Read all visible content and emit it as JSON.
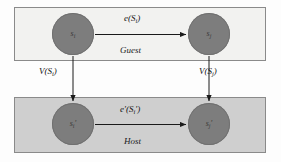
{
  "figure": {
    "type": "diagram",
    "background_color": "#fdfdfd"
  },
  "panels": [
    {
      "id": "guest",
      "label": "Guest",
      "fill_color": "#f2f2f0",
      "border_color": "#8a8a8a"
    },
    {
      "id": "host",
      "label": "Host",
      "fill_color": "#cfcfcf",
      "border_color": "#8a8a8a"
    }
  ],
  "nodes": [
    {
      "id": "guest_i",
      "label": "s",
      "subscript": "i",
      "prime": "",
      "fill_color": "#7d7d7d"
    },
    {
      "id": "guest_j",
      "label": "s",
      "subscript": "j",
      "prime": "",
      "fill_color": "#7d7d7d"
    },
    {
      "id": "host_i",
      "label": "s",
      "subscript": "i",
      "prime": "'",
      "fill_color": "#7d7d7d"
    },
    {
      "id": "host_j",
      "label": "s",
      "subscript": "j",
      "prime": "'",
      "fill_color": "#7d7d7d"
    }
  ],
  "edges": {
    "guest_edge": {
      "label_function": "e",
      "label_arg": "S",
      "label_sub": "i",
      "label_full": "e(S i )"
    },
    "host_edge": {
      "label_function": "e'",
      "label_arg": "S",
      "label_sub": "i",
      "label_prime": "'",
      "label_full": "e'(S i ')"
    },
    "map_left": {
      "label_function": "V",
      "label_arg": "S",
      "label_sub": "i",
      "label_full": "V(S i )"
    },
    "map_right": {
      "label_function": "V",
      "label_arg": "S",
      "label_sub": "j",
      "label_full": "V(S j )"
    }
  },
  "arrow_color": "#1a1a1a"
}
